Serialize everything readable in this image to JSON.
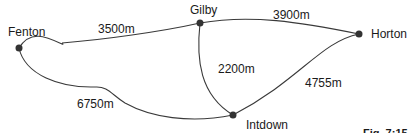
{
  "diagram": {
    "type": "network-graph",
    "figure_label": "Fig. 7:15",
    "nodes": [
      {
        "id": "fenton",
        "label": "Fenton"
      },
      {
        "id": "gilby",
        "label": "Gilby"
      },
      {
        "id": "horton",
        "label": "Horton"
      },
      {
        "id": "intdown",
        "label": "Intdown"
      }
    ],
    "edges": [
      {
        "from": "fenton",
        "to": "gilby",
        "label": "3500m"
      },
      {
        "from": "gilby",
        "to": "horton",
        "label": "3900m"
      },
      {
        "from": "gilby",
        "to": "intdown",
        "label": "2200m"
      },
      {
        "from": "horton",
        "to": "intdown",
        "label": "4755m"
      },
      {
        "from": "fenton",
        "to": "intdown",
        "label": "6750m"
      }
    ]
  }
}
